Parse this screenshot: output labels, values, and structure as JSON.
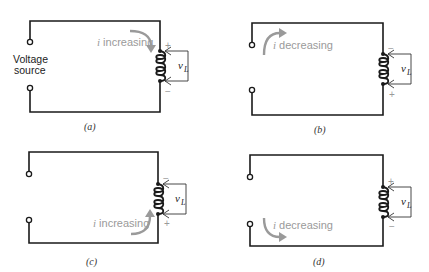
{
  "figure": {
    "panels": [
      {
        "id": "a",
        "caption": "(a)",
        "current_label_i": "i",
        "current_label": " increasing",
        "source_label_line1": "Voltage",
        "source_label_line2": "source",
        "voltage_label": "v",
        "voltage_sub": "L",
        "top_sign": "+",
        "bottom_sign": "−"
      },
      {
        "id": "b",
        "caption": "(b)",
        "current_label_i": "i",
        "current_label": " decreasing",
        "voltage_label": "v",
        "voltage_sub": "L",
        "top_sign": "−",
        "bottom_sign": "+"
      },
      {
        "id": "c",
        "caption": "(c)",
        "current_label_i": "i",
        "current_label": " increasing",
        "voltage_label": "v",
        "voltage_sub": "L",
        "top_sign": "−",
        "bottom_sign": "+"
      },
      {
        "id": "d",
        "caption": "(d)",
        "current_label_i": "i",
        "current_label": " decreasing",
        "voltage_label": "v",
        "voltage_sub": "L",
        "top_sign": "+",
        "bottom_sign": "−"
      }
    ],
    "colors": {
      "wire": "#1a1a1a",
      "current_arrow": "#9a9a9a",
      "background": "#ffffff"
    }
  }
}
